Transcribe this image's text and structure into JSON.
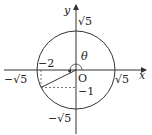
{
  "diagram": {
    "type": "unit-circle-angle",
    "axes": {
      "x_label": "x",
      "y_label": "y",
      "origin_label": "O"
    },
    "circle": {
      "radius_label": "√5"
    },
    "ticks": {
      "x_pos": "√5",
      "x_neg": "−√5",
      "y_pos": "√5",
      "y_neg": "−√5"
    },
    "point": {
      "x": -2,
      "y": -1,
      "x_label": "−2",
      "y_label": "−1"
    },
    "angle_label": "θ",
    "colors": {
      "stroke": "#333333",
      "dashed": "#555555",
      "background": "#ffffff"
    }
  }
}
